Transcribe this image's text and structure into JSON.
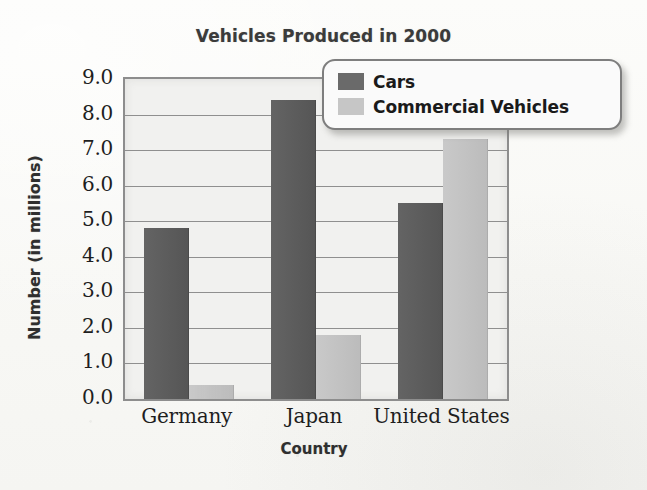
{
  "chart_data": {
    "type": "bar",
    "title": "Vehicles Produced in 2000",
    "xlabel": "Country",
    "ylabel": "Number (in millions)",
    "categories": [
      "Germany",
      "Japan",
      "United States"
    ],
    "series": [
      {
        "name": "Cars",
        "color": "#5a5a5a",
        "values": [
          4.8,
          8.4,
          5.5
        ]
      },
      {
        "name": "Commercial Vehicles",
        "color": "#c3c3c3",
        "values": [
          0.4,
          1.8,
          7.3
        ]
      }
    ],
    "ylim": [
      0.0,
      9.0
    ],
    "ytick_step": 1.0,
    "ytick_labels": [
      "9.0",
      "8.0",
      "7.0",
      "6.0",
      "5.0",
      "4.0",
      "3.0",
      "2.0",
      "1.0",
      "0.0"
    ],
    "grid": true,
    "legend_position": "top-right"
  },
  "legend": {
    "entries": [
      {
        "label": "Cars",
        "swatch": "cars-swatch"
      },
      {
        "label": "Commercial Vehicles",
        "swatch": "commercial-vehicles-swatch"
      }
    ]
  }
}
